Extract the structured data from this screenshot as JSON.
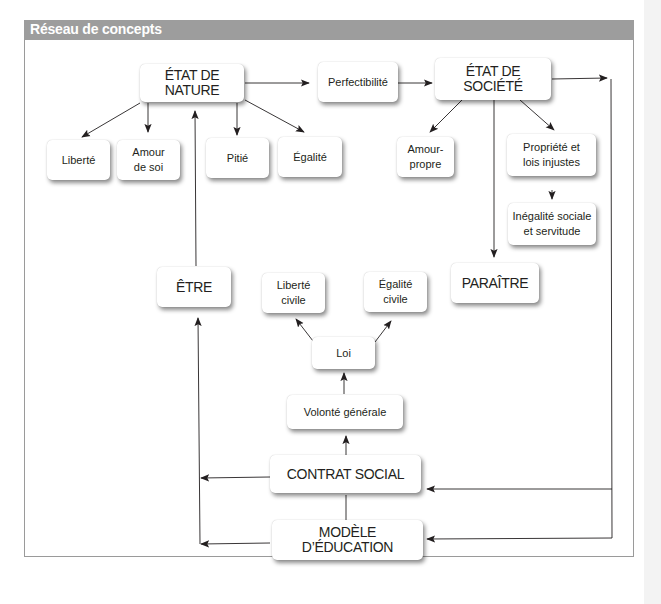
{
  "panel": {
    "title": "Réseau de concepts",
    "header_color": "#9d9d9d"
  },
  "nodes": {
    "etat_nature": "ÉTAT DE NATURE",
    "perfectibilite": "Perfectibilité",
    "etat_societe": "ÉTAT DE SOCIÉTÉ",
    "liberte": "Liberté",
    "amour_soi": "Amour\nde soi",
    "pitie": "Pitié",
    "egalite": "Égalité",
    "amour_propre": "Amour-\npropre",
    "propriete": "Propriété et\nlois injustes",
    "inegalite": "Inégalité sociale\net servitude",
    "paraitre": "PARAÎTRE",
    "etre": "ÊTRE",
    "liberte_civile": "Liberté\ncivile",
    "egalite_civile": "Égalité\ncivile",
    "loi": "Loi",
    "volonte_generale": "Volonté générale",
    "contrat_social": "CONTRAT SOCIAL",
    "modele_education": "MODÈLE D’ÉDUCATION"
  },
  "edges": [
    {
      "from": "ÉTAT DE NATURE",
      "to": "Perfectibilité"
    },
    {
      "from": "Perfectibilité",
      "to": "ÉTAT DE SOCIÉTÉ"
    },
    {
      "from": "ÉTAT DE NATURE",
      "to": "Liberté"
    },
    {
      "from": "ÉTAT DE NATURE",
      "to": "Amour de soi"
    },
    {
      "from": "ÉTAT DE NATURE",
      "to": "Pitié"
    },
    {
      "from": "ÉTAT DE NATURE",
      "to": "Égalité"
    },
    {
      "from": "ÉTAT DE SOCIÉTÉ",
      "to": "Amour-propre"
    },
    {
      "from": "ÉTAT DE SOCIÉTÉ",
      "to": "Propriété et lois injustes"
    },
    {
      "from": "Propriété et lois injustes",
      "to": "Inégalité sociale et servitude"
    },
    {
      "from": "ÉTAT DE SOCIÉTÉ",
      "to": "PARAÎTRE"
    },
    {
      "from": "ÊTRE",
      "to": "ÉTAT DE NATURE"
    },
    {
      "from": "Loi",
      "to": "Liberté civile"
    },
    {
      "from": "Loi",
      "to": "Égalité civile"
    },
    {
      "from": "Volonté générale",
      "to": "Loi"
    },
    {
      "from": "CONTRAT SOCIAL",
      "to": "Volonté générale"
    },
    {
      "from": "CONTRAT SOCIAL",
      "to": "ÊTRE"
    },
    {
      "from": "MODÈLE D’ÉDUCATION",
      "to": "ÊTRE"
    },
    {
      "from": "ÉTAT DE SOCIÉTÉ",
      "to": "CONTRAT SOCIAL"
    },
    {
      "from": "ÉTAT DE SOCIÉTÉ",
      "to": "MODÈLE D’ÉDUCATION"
    }
  ]
}
